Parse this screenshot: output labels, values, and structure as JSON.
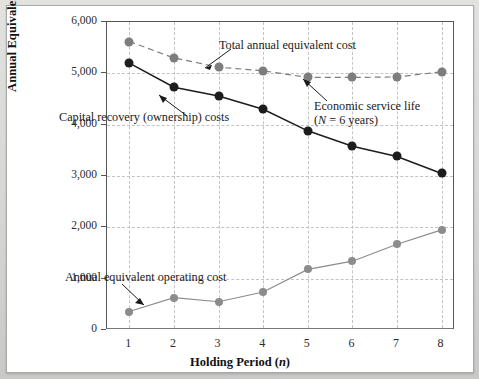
{
  "figure": {
    "x_axis_title_main": "Holding Period (",
    "x_axis_title_var": "n",
    "x_axis_title_end": ")",
    "y_axis_title": "Annual Equivalent Cost ($)",
    "y_ticks": [
      "6,000",
      "5,000",
      "4,000",
      "3,000",
      "2,000",
      "1,000",
      "0"
    ],
    "x_ticks": [
      "1",
      "2",
      "3",
      "4",
      "5",
      "6",
      "7",
      "8"
    ],
    "annotations": {
      "total_cost": "Total annual equivalent cost",
      "capital_recovery": "Capital recovery (ownership) costs",
      "operating_cost": "Annual equivalent operating cost",
      "economic_service_life_line1": "Economic service life",
      "economic_service_life_line2_pre": "(",
      "economic_service_life_line2_var": "N",
      "economic_service_life_line2_post": " = 6 years)"
    },
    "colors": {
      "capital_recovery": "#1d1d1d",
      "total_cost": "#7d7d7d",
      "operating_cost": "#8c8c8c",
      "gridline": "#c3c3c3",
      "axis": "#555555",
      "panel_background": "#ffffff",
      "page_background": "#d6d6d4"
    }
  },
  "chart_data": {
    "type": "line",
    "title": "",
    "xlabel": "Holding Period (n)",
    "ylabel": "Annual Equivalent Cost ($)",
    "x": [
      1,
      2,
      3,
      4,
      5,
      6,
      7,
      8
    ],
    "xlim": [
      0.5,
      8.3
    ],
    "ylim": [
      0,
      6000
    ],
    "grid": true,
    "legend": "none (inline annotations)",
    "series": [
      {
        "name": "Total annual equivalent cost",
        "style": "dashed",
        "marker": "circle",
        "color": "#7d7d7d",
        "values": [
          5620,
          5300,
          5120,
          5050,
          4920,
          4920,
          4930,
          5030
        ]
      },
      {
        "name": "Capital recovery (ownership) costs",
        "style": "solid",
        "marker": "circle",
        "color": "#1d1d1d",
        "values": [
          5200,
          4730,
          4560,
          4300,
          3880,
          3580,
          3380,
          3050
        ]
      },
      {
        "name": "Annual equivalent operating cost",
        "style": "solid",
        "marker": "circle",
        "color": "#8c8c8c",
        "values": [
          360,
          630,
          550,
          740,
          1180,
          1340,
          1670,
          1950
        ]
      }
    ],
    "annotations": [
      {
        "text": "Total annual equivalent cost",
        "points_to_x": 3,
        "points_to_series": "Total annual equivalent cost"
      },
      {
        "text": "Capital recovery (ownership) costs",
        "points_to_x": 3,
        "points_to_series": "Capital recovery (ownership) costs"
      },
      {
        "text": "Annual equivalent operating cost",
        "points_to_x": 2,
        "points_to_series": "Annual equivalent operating cost"
      },
      {
        "text": "Economic service life (N = 6 years)",
        "points_to_x": 6,
        "points_to_series": "Total annual equivalent cost"
      }
    ]
  }
}
